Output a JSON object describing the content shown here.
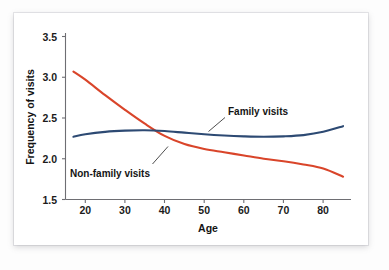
{
  "chart_data": {
    "type": "line",
    "title": "",
    "xlabel": "Age",
    "ylabel": "Frequency of visits",
    "xlim": [
      15,
      87
    ],
    "ylim": [
      1.5,
      3.5
    ],
    "grid": false,
    "legend_position": "inline-annotations",
    "x_ticks": [
      "20",
      "30",
      "40",
      "50",
      "60",
      "70",
      "80"
    ],
    "x_tick_values": [
      20,
      30,
      40,
      50,
      60,
      70,
      80
    ],
    "y_ticks": [
      "1.5",
      "2.0",
      "2.5",
      "3.0",
      "3.5"
    ],
    "y_tick_values": [
      1.5,
      2.0,
      2.5,
      3.0,
      3.5
    ],
    "x": [
      17,
      20,
      25,
      30,
      35,
      40,
      45,
      50,
      55,
      60,
      65,
      70,
      75,
      80,
      85
    ],
    "series": [
      {
        "name": "Family visits",
        "color": "#2d4a73",
        "values": [
          2.27,
          2.3,
          2.33,
          2.345,
          2.35,
          2.34,
          2.32,
          2.3,
          2.285,
          2.275,
          2.27,
          2.275,
          2.29,
          2.33,
          2.4
        ]
      },
      {
        "name": "Non-family visits",
        "color": "#d9452a",
        "values": [
          3.07,
          2.97,
          2.78,
          2.6,
          2.43,
          2.28,
          2.18,
          2.12,
          2.08,
          2.04,
          2.0,
          1.97,
          1.93,
          1.88,
          1.78
        ]
      }
    ],
    "annotations": [
      {
        "name": "family-visits-callout",
        "text": "Family visits",
        "points_to_x": 51,
        "points_to_y": 2.3
      },
      {
        "name": "non-family-visits-callout",
        "text": "Non-family visits",
        "points_to_x": 47,
        "points_to_y": 2.16
      }
    ],
    "colors": {
      "family": "#2d4a73",
      "non_family": "#d9452a",
      "axis": "#6e6e73",
      "text": "#141414",
      "card_background": "#ffffff",
      "page_background": "#fdfdfd"
    }
  }
}
